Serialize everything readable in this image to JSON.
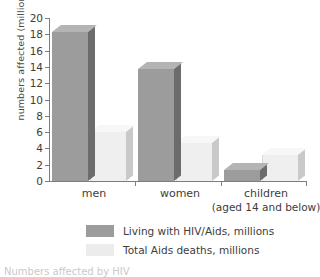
{
  "chart_data": {
    "type": "bar",
    "title": "",
    "subtitle": "",
    "xlabel": "",
    "ylabel": "numbers affected (millions)",
    "categories": [
      "men",
      "women",
      "children"
    ],
    "category_sublabels": [
      "",
      "",
      "(aged 14 and below)"
    ],
    "series": [
      {
        "name": "Living with HIV/Aids, millions",
        "values": [
          18.3,
          13.8,
          1.3
        ],
        "color": "#9c9c9c"
      },
      {
        "name": "Total Aids deaths, millions",
        "values": [
          6.0,
          4.7,
          3.2
        ],
        "color": "#efefef"
      }
    ],
    "ylim": [
      0,
      20
    ],
    "yticks": [
      0,
      2,
      4,
      6,
      8,
      10,
      12,
      14,
      16,
      18,
      20
    ],
    "ytick_labels": [
      "0",
      "2",
      "4",
      "6",
      "8",
      "10",
      "12",
      "14",
      "16",
      "18",
      "20"
    ],
    "grid": false,
    "legend_position": "bottom",
    "style": "3d-bars-grayscale"
  },
  "legend": {
    "items": [
      {
        "label": "Living with HIV/Aids, millions",
        "swatch": "#9c9c9c"
      },
      {
        "label": "Total Aids deaths, millions",
        "swatch": "#ececec"
      }
    ]
  },
  "caption": {
    "text": "Numbers affected by HIV"
  },
  "axis": {
    "y_title": "numbers affected (millions)"
  }
}
